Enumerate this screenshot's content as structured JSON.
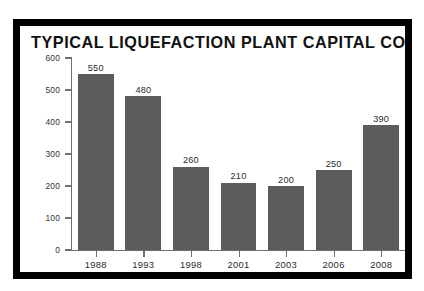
{
  "chart_data": {
    "type": "bar",
    "title": "TYPICAL LIQUEFACTION PLANT CAPITAL COSTS",
    "xlabel": "",
    "ylabel": "$ million per million tonnes/year",
    "categories": [
      "1988",
      "1993",
      "1998",
      "2001",
      "2003",
      "2006",
      "2008"
    ],
    "values": [
      550,
      480,
      260,
      210,
      200,
      250,
      390
    ],
    "value_labels": [
      "550",
      "480",
      "260",
      "210",
      "200",
      "250",
      "390"
    ],
    "ylim": [
      0,
      600
    ],
    "y_ticks": [
      0,
      100,
      200,
      300,
      400,
      500,
      600
    ],
    "y_tick_labels": [
      "0",
      "100",
      "200",
      "300",
      "400",
      "500",
      "600"
    ],
    "grid": false,
    "legend": false,
    "legend_position": "none",
    "bar_color": "#5c5c5c",
    "axis_color": "#6f6f6f",
    "frame_color": "#000000",
    "panel_background": "#ffffff",
    "text_color": "#2b2b2b"
  }
}
